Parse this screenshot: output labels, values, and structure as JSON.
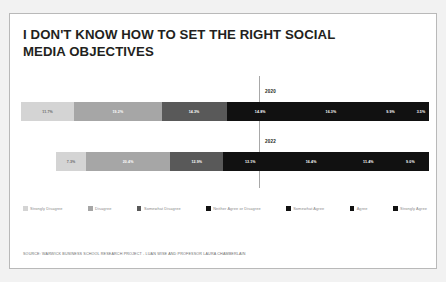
{
  "card": {
    "title": "I DON'T KNOW HOW TO SET THE RIGHT SOCIAL MEDIA OBJECTIVES",
    "source": "SOURCE: WARWICK BUSINESS SCHOOL RESEARCH PROJECT - LUAN WISE AND PROFESSOR LAURA CHAMBERLAIN"
  },
  "legend": {
    "items": [
      {
        "label": "Strongly Disagree",
        "color": "#d4d4d4"
      },
      {
        "label": "Disagree",
        "color": "#a6a6a6"
      },
      {
        "label": "Somewhat Disagree",
        "color": "#595959"
      },
      {
        "label": "Neither Agree or Disagree",
        "color": "#111111"
      },
      {
        "label": "Somewhat Agree",
        "color": "#111111"
      },
      {
        "label": "Agree",
        "color": "#111111"
      },
      {
        "label": "Strongly Agree",
        "color": "#111111"
      }
    ]
  },
  "chart_data": {
    "type": "bar",
    "subtype": "diverging-stacked-likert",
    "title": "I DON'T KNOW HOW TO SET THE RIGHT SOCIAL MEDIA OBJECTIVES",
    "xlabel": "",
    "ylabel": "",
    "grid": false,
    "legend_position": "bottom",
    "neutral_divider": true,
    "categories": [
      "Strongly Disagree",
      "Disagree",
      "Somewhat Disagree",
      "Neither Agree or Disagree",
      "Somewhat Agree",
      "Agree",
      "Strongly Agree"
    ],
    "colors": [
      "#d4d4d4",
      "#a6a6a6",
      "#595959",
      "#111111",
      "#111111",
      "#111111",
      "#111111"
    ],
    "text_colors": [
      "#6b6b6b",
      "#ffffff",
      "#ffffff",
      "#ffffff",
      "#ffffff",
      "#ffffff",
      "#ffffff"
    ],
    "series": [
      {
        "name": "2020",
        "values": [
          11.7,
          19.2,
          14.3,
          14.8,
          16.3,
          9.9,
          3.5
        ],
        "labels": [
          "11.7%",
          "19.2%",
          "14.3%",
          "14.8%",
          "16.3%",
          "9.9%",
          "3.5%"
        ]
      },
      {
        "name": "2022",
        "values": [
          7.3,
          20.4,
          12.9,
          13.1,
          16.4,
          11.4,
          9.0
        ],
        "labels": [
          "7.3%",
          "20.4%",
          "12.9%",
          "13.1%",
          "16.4%",
          "11.4%",
          "9.0%"
        ]
      }
    ]
  }
}
